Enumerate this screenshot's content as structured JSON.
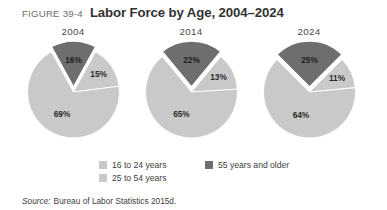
{
  "figure": {
    "number": "FIGURE 39-4",
    "title": "Labor Force by Age, 2004–2024"
  },
  "source": {
    "label": "Source:",
    "text": "Bureau of Labor Statistics 2015d."
  },
  "legend": {
    "items": [
      {
        "label": "16 to 24 years",
        "color": "#c9c9c9"
      },
      {
        "label": "25 to 54 years",
        "color": "#c9c9c9"
      },
      {
        "label": "55 years and older",
        "color": "#6e6e6e"
      }
    ]
  },
  "colors": {
    "light_gray": "#c9c9c9",
    "mid_gray": "#c4c4c4",
    "dark_gray": "#6e6e6e",
    "divider": "#ffffff",
    "title": "#323232",
    "figure_number": "#6d6d6d"
  },
  "charts": [
    {
      "year": "2004",
      "labels": [
        "16%",
        "15%",
        "69%"
      ]
    },
    {
      "year": "2014",
      "labels": [
        "22%",
        "13%",
        "65%"
      ]
    },
    {
      "year": "2024",
      "labels": [
        "25%",
        "11%",
        "64%"
      ]
    }
  ],
  "chart_data": {
    "type": "pie",
    "title": "Labor Force by Age, 2004–2024",
    "subtitle": "FIGURE 39-4",
    "legend_position": "bottom-center",
    "categories": [
      "55 years and older",
      "16 to 24 years",
      "25 to 54 years"
    ],
    "colors": [
      "#6e6e6e",
      "#c9c9c9",
      "#c9c9c9"
    ],
    "exploded_slice": "55 years and older",
    "units": "percent",
    "panels": [
      {
        "name": "2004",
        "values": [
          16,
          15,
          69
        ],
        "labels": [
          "16%",
          "15%",
          "69%"
        ]
      },
      {
        "name": "2014",
        "values": [
          22,
          13,
          65
        ],
        "labels": [
          "22%",
          "13%",
          "65%"
        ]
      },
      {
        "name": "2024",
        "values": [
          25,
          11,
          64
        ],
        "labels": [
          "25%",
          "11%",
          "64%"
        ]
      }
    ],
    "source": "Bureau of Labor Statistics 2015d."
  }
}
